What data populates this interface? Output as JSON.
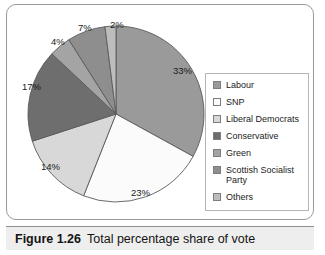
{
  "caption": {
    "figure_number": "Figure 1.26",
    "text": "Total percentage share of vote"
  },
  "legend": {
    "items": [
      {
        "label": "Labour",
        "color": "#9a9a9a"
      },
      {
        "label": "SNP",
        "color": "#fbfbfb"
      },
      {
        "label": "Liberal Democrats",
        "color": "#d8d8d8"
      },
      {
        "label": "Conservative",
        "color": "#6e6e6e"
      },
      {
        "label": "Green",
        "color": "#a4a4a4"
      },
      {
        "label": "Scottish Socialist Party",
        "color": "#8e8e8e"
      },
      {
        "label": "Others",
        "color": "#bdbdbd"
      }
    ]
  },
  "chart_data": {
    "type": "pie",
    "title": "Total percentage share of vote",
    "unit": "%",
    "start_angle_deg": 0,
    "direction": "clockwise",
    "legend_position": "right",
    "grid": false,
    "categories": [
      "Labour",
      "SNP",
      "Liberal Democrats",
      "Conservative",
      "Green",
      "Scottish Socialist Party",
      "Others"
    ],
    "values": [
      33,
      23,
      14,
      17,
      4,
      7,
      2
    ],
    "colors": [
      "#9a9a9a",
      "#fbfbfb",
      "#d8d8d8",
      "#6e6e6e",
      "#a4a4a4",
      "#8e8e8e",
      "#bdbdbd"
    ],
    "data_labels": [
      "33%",
      "23%",
      "14%",
      "17%",
      "4%",
      "7%",
      "2%"
    ],
    "slice_label_positions": [
      {
        "label": "33%",
        "left": 152,
        "top": 46
      },
      {
        "label": "23%",
        "left": 110,
        "top": 168
      },
      {
        "label": "14%",
        "left": 20,
        "top": 142
      },
      {
        "label": "17%",
        "left": 1,
        "top": 62
      },
      {
        "label": "4%",
        "left": 30,
        "top": 17
      },
      {
        "label": "7%",
        "left": 57,
        "top": 3
      },
      {
        "label": "2%",
        "left": 89,
        "top": 0
      }
    ]
  }
}
